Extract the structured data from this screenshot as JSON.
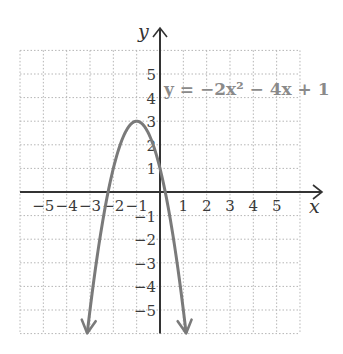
{
  "chart_data": {
    "type": "line",
    "title": "",
    "equation_label": "y = −2x² − 4x + 1",
    "function": {
      "a": -2,
      "b": -4,
      "c": 1
    },
    "vertex": [
      -1,
      3
    ],
    "y_intercept": 1,
    "x_intercepts": [
      -2.22,
      0.22
    ],
    "xlabel": "x",
    "ylabel": "y",
    "xlim": [
      -6,
      6
    ],
    "ylim": [
      -6,
      6
    ],
    "grid": true,
    "x_ticks": [
      -5,
      -4,
      -3,
      -2,
      -1,
      1,
      2,
      3,
      4,
      5
    ],
    "y_ticks": [
      -5,
      -4,
      -3,
      -2,
      -1,
      1,
      2,
      3,
      4,
      5
    ],
    "x_tick_labels": [
      "−5",
      "−4",
      "−3",
      "−2",
      "−1",
      "1",
      "2",
      "3",
      "4",
      "5"
    ],
    "y_tick_labels": [
      "5",
      "4",
      "3",
      "2",
      "1",
      "−1",
      "−2",
      "−3",
      "−4",
      "−5"
    ],
    "series": [
      {
        "name": "y = −2x² − 4x + 1",
        "x": [
          -3.12,
          -3,
          -2.5,
          -2,
          -1.5,
          -1,
          -0.5,
          0,
          0.5,
          1,
          1.12
        ],
        "y": [
          -6,
          -5,
          -1.5,
          1,
          2.5,
          3,
          2.5,
          1,
          -1.5,
          -5,
          -6
        ],
        "color": "#7a7a7a",
        "arrows_both_ends": true
      }
    ]
  },
  "colors": {
    "curve": "#7a7a7a",
    "axis": "#333333",
    "grid": "#b5b5b5",
    "label": "#8a8a8a"
  }
}
